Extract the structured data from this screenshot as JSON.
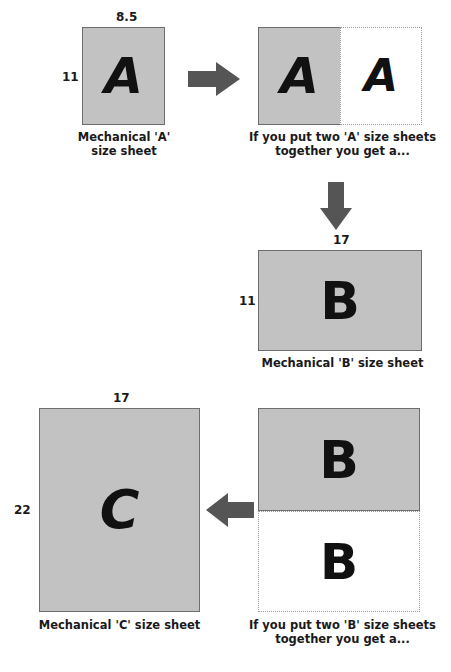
{
  "figure": {
    "clipped_header": "",
    "colors": {
      "sheet_fill": "#c2c2c2",
      "sheet_border": "#6e6e6e",
      "ghost_border": "#9a9a9a",
      "arrow": "#555555",
      "text": "#1a1a1a",
      "background": "#ffffff"
    }
  },
  "steps": {
    "a_sheet": {
      "glyph": "A",
      "width_label": "8.5",
      "height_label": "11",
      "caption": "Mechanical 'A'\nsize sheet"
    },
    "a_pair": {
      "glyph_solid": "A",
      "glyph_ghost": "A",
      "caption": "If you put two 'A' size sheets\ntogether you get a..."
    },
    "b_sheet": {
      "glyph": "B",
      "width_label": "17",
      "height_label": "11",
      "caption": "Mechanical 'B' size sheet"
    },
    "b_pair": {
      "glyph_solid": "B",
      "glyph_ghost": "B",
      "caption": "If you put two 'B' size sheets\ntogether you get a..."
    },
    "c_sheet": {
      "glyph": "C",
      "width_label": "17",
      "height_label": "22",
      "caption": "Mechanical 'C' size sheet"
    }
  },
  "arrows": {
    "a_to_pair": "arrow-right",
    "pair_to_b": "arrow-down",
    "bpair_to_c": "arrow-left"
  }
}
